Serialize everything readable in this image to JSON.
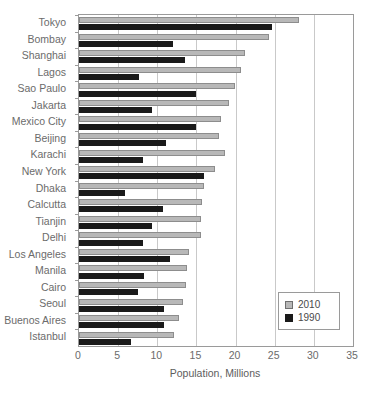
{
  "chart_data": {
    "type": "bar",
    "orientation": "horizontal",
    "title": "",
    "xlabel": "Population, Millions",
    "ylabel": "",
    "xlim": [
      0,
      35
    ],
    "xticks": [
      0,
      5,
      10,
      15,
      20,
      25,
      30,
      35
    ],
    "grid": true,
    "legend_position": "lower-right",
    "categories": [
      "Tokyo",
      "Bombay",
      "Shanghai",
      "Lagos",
      "Sao Paulo",
      "Jakarta",
      "Mexico City",
      "Beijing",
      "Karachi",
      "New York",
      "Dhaka",
      "Calcutta",
      "Tianjin",
      "Delhi",
      "Los Angeles",
      "Manila",
      "Cairo",
      "Seoul",
      "Buenos Aires",
      "Istanbul"
    ],
    "series": [
      {
        "name": "2010",
        "color": "#b8b8b8",
        "values": [
          28.1,
          24.3,
          21.2,
          20.7,
          19.9,
          19.2,
          18.1,
          17.9,
          18.6,
          17.4,
          16.0,
          15.7,
          15.6,
          15.6,
          14.1,
          13.8,
          13.7,
          13.3,
          12.8,
          12.1
        ]
      },
      {
        "name": "1990",
        "color": "#1a1a1a",
        "values": [
          24.6,
          12.0,
          13.5,
          7.7,
          14.9,
          9.3,
          14.9,
          11.1,
          8.2,
          16.0,
          5.9,
          10.7,
          9.3,
          8.2,
          11.6,
          8.3,
          7.5,
          10.9,
          10.9,
          6.6
        ]
      }
    ]
  },
  "legend": {
    "items": [
      {
        "label": "2010",
        "swatch": "light-gray-square"
      },
      {
        "label": "1990",
        "swatch": "black-square"
      }
    ]
  }
}
